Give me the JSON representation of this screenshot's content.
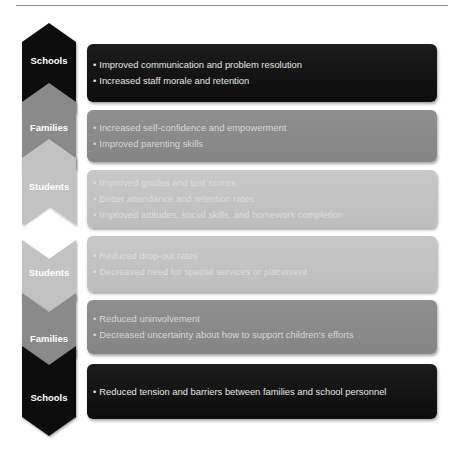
{
  "diagram": {
    "colors": {
      "dark": "#111111",
      "mid": "#8a8a8a",
      "light": "#c2c2c2",
      "rule": "#8a8a8a"
    },
    "rows": [
      {
        "label": "Schools",
        "shade": "dark",
        "items": [
          "Improved communication and problem resolution",
          "Increased staff morale and retention"
        ]
      },
      {
        "label": "Families",
        "shade": "mid",
        "items": [
          "Increased self-confidence and empowerment",
          "Improved parenting skills"
        ]
      },
      {
        "label": "Students",
        "shade": "light",
        "items": [
          "Improved grades and test scores",
          "Better attendance and retention rates",
          "Improved attitudes, social skills, and homework completion"
        ]
      },
      {
        "label": "Students",
        "shade": "light",
        "items": [
          "Reduced drop-out rates",
          "Decreased need for special services or placement"
        ]
      },
      {
        "label": "Families",
        "shade": "mid",
        "items": [
          "Reduced uninvolvement",
          "Decreased uncertainty about how to support children's efforts"
        ]
      },
      {
        "label": "Schools",
        "shade": "dark",
        "items": [
          "Reduced tension and barriers between families and school personnel"
        ]
      }
    ]
  }
}
